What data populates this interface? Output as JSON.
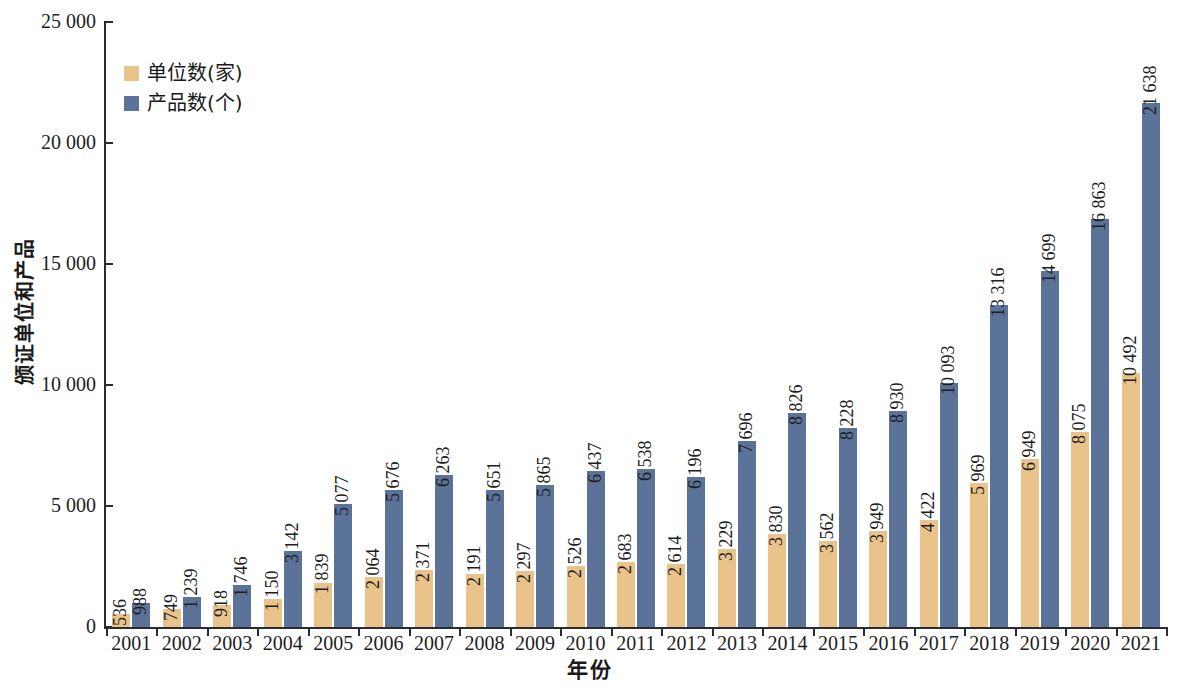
{
  "chart_data": {
    "type": "bar",
    "title": "",
    "xlabel": "年份",
    "ylabel": "颁证单位和产品",
    "ylim": [
      0,
      25000
    ],
    "ytick_labels": [
      "0",
      "5 000",
      "10 000",
      "15 000",
      "20 000",
      "25 000"
    ],
    "ytick_values": [
      0,
      5000,
      10000,
      15000,
      20000,
      25000
    ],
    "grid": false,
    "legend_position": "top-left",
    "categories": [
      "2001",
      "2002",
      "2003",
      "2004",
      "2005",
      "2006",
      "2007",
      "2008",
      "2009",
      "2010",
      "2011",
      "2012",
      "2013",
      "2014",
      "2015",
      "2016",
      "2017",
      "2018",
      "2019",
      "2020",
      "2021"
    ],
    "series": [
      {
        "name": "单位数(家)",
        "color": "#e9c389",
        "values": [
          536,
          749,
          918,
          1150,
          1839,
          2064,
          2371,
          2191,
          2297,
          2526,
          2683,
          2614,
          3229,
          3830,
          3562,
          3949,
          4422,
          5969,
          6949,
          8075,
          10492
        ],
        "labels": [
          "536",
          "749",
          "918",
          "1 150",
          "1 839",
          "2 064",
          "2 371",
          "2 191",
          "2 297",
          "2 526",
          "2 683",
          "2 614",
          "3 229",
          "3 830",
          "3 562",
          "3 949",
          "4 422",
          "5 969",
          "6 949",
          "8 075",
          "10 492"
        ]
      },
      {
        "name": "产品数(个)",
        "color": "#5c7399",
        "values": [
          988,
          1239,
          1746,
          3142,
          5077,
          5676,
          6263,
          5651,
          5865,
          6437,
          6538,
          6196,
          7696,
          8826,
          8228,
          8930,
          10093,
          13316,
          14699,
          16863,
          21638
        ],
        "labels": [
          "988",
          "1 239",
          "1 746",
          "3 142",
          "5 077",
          "5 676",
          "6 263",
          "5 651",
          "5 865",
          "6 437",
          "6 538",
          "6 196",
          "7 696",
          "8 826",
          "8 228",
          "8 930",
          "10 093",
          "13 316",
          "14 699",
          "16 863",
          "21 638"
        ]
      }
    ]
  },
  "axis_color": "#2b2b33"
}
